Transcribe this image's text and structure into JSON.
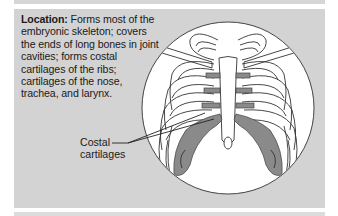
{
  "description": {
    "heading": "Location:",
    "text": " Forms most of the embryonic skeleton; covers the ends of long bones in joint cavities; forms costal cartilages of the ribs; cartilages of the nose, trachea, and larynx."
  },
  "figure": {
    "labels": [
      {
        "line1": "Costal",
        "line2": "cartilages"
      }
    ]
  },
  "colors": {
    "panel": "#d3d3d3",
    "cartilage": "#8a8a8a",
    "circle_fill": "#ffffff",
    "outline": "#333333"
  }
}
